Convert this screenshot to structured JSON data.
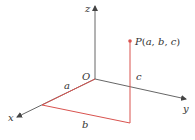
{
  "diagram": {
    "type": "3d-coordinate-system",
    "axes": {
      "x": {
        "label": "x"
      },
      "y": {
        "label": "y"
      },
      "z": {
        "label": "z"
      },
      "origin": {
        "label": "O"
      }
    },
    "point": {
      "label": "P(a, b, c)",
      "label_parts": {
        "name": "P",
        "open": "(",
        "a": "a",
        "sep1": ", ",
        "b": "b",
        "sep2": ", ",
        "c": "c",
        "close": ")"
      }
    },
    "segments": {
      "a": {
        "label": "a"
      },
      "b": {
        "label": "b"
      },
      "c": {
        "label": "c"
      }
    },
    "colors": {
      "axis": "#444444",
      "highlight": "#d9534f",
      "text": "#333333"
    }
  }
}
